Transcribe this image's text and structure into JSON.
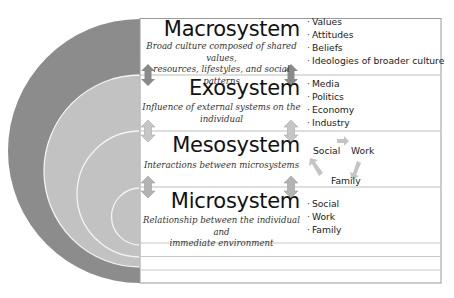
{
  "diagram": {
    "type": "bronfenbrenner-ecological-systems",
    "colors": {
      "macro_ring": "#8c8c8c",
      "inner_fill": "#c2c2c2",
      "ring_line": "#f4f4f4",
      "box_border": "#9a9a9a",
      "divider": "#bdbdbd",
      "arrow_macro": "#8a8a8a",
      "arrow_exo": "#c6c6c6",
      "arrow_meso": "#b3b3b3",
      "cycle_arrow": "#c4c4c4"
    },
    "layers": [
      {
        "name": "Macrosystem",
        "description": "Broad culture composed of shared values, resources, lifestyles, and social patterns",
        "desc_lines": [
          "Broad culture composed of shared values,",
          "resources, lifestyles, and social patterns"
        ],
        "items": [
          "Values",
          "Attitudes",
          "Beliefs",
          "Ideologies of broader culture"
        ]
      },
      {
        "name": "Exosystem",
        "description": "Influence of external systems on the individual",
        "desc_lines": [
          "Influence of external systems on the",
          "individual"
        ],
        "items": [
          "Media",
          "Politics",
          "Economy",
          "Industry"
        ]
      },
      {
        "name": "Mesosystem",
        "description": "Interactions between microsystems",
        "desc_lines": [
          "Interactions between microsystems"
        ],
        "cycle": [
          "Social",
          "Work",
          "Family"
        ]
      },
      {
        "name": "Microsystem",
        "description": "Relationship between the individual and immediate environment",
        "desc_lines": [
          "Relationship between the individual and",
          "immediate environment"
        ],
        "items": [
          "Social",
          "Work",
          "Family"
        ]
      }
    ]
  }
}
